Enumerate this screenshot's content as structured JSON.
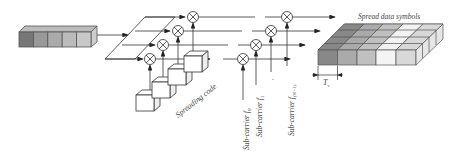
{
  "diagram": {
    "type": "MC-CDMA transmitter block diagram",
    "labels": {
      "spread_data_symbols": "Spread data symbols",
      "spreading_code": "Spreading code",
      "symbol_period": "T",
      "symbol_period_sub": "s",
      "subcarriers": [
        {
          "text": "Sub-carrier f",
          "sub": "0"
        },
        {
          "text": "Sub-carrier f",
          "sub": "1"
        },
        {
          "text": "Sub-carrier f",
          "sub": "(N−1)"
        }
      ]
    },
    "code_boxes": [
      "c₁",
      "c",
      "c",
      "c₀"
    ],
    "output_blocks": {
      "rows": 4,
      "cols": 5,
      "side_labels": [
        "c₁",
        "c₁",
        "c₀"
      ]
    },
    "input_blocks": 5,
    "colors": {
      "dark": "#7f7f7f",
      "mid": "#a8a8a8",
      "light": "#c4c4c4",
      "lighter": "#dcdcdc",
      "white": "#f4f4f4",
      "line": "#333333"
    }
  }
}
